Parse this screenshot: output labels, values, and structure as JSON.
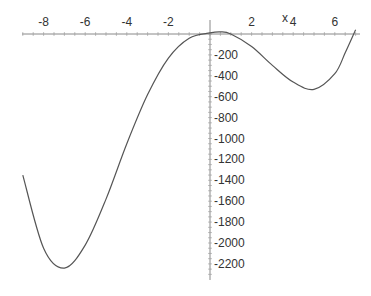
{
  "chart_data": {
    "type": "line",
    "title": "",
    "xlabel": "x",
    "ylabel": "",
    "xlim": [
      -9,
      7
    ],
    "ylim": [
      -2300,
      50
    ],
    "x_ticks": [
      -8,
      -6,
      -4,
      -2,
      2,
      4,
      6
    ],
    "y_ticks": [
      -200,
      -400,
      -600,
      -800,
      -1000,
      -1200,
      -1400,
      -1600,
      -1800,
      -2000,
      -2200
    ],
    "grid": false,
    "series": [
      {
        "name": "f(x)",
        "x": [
          -9,
          -8,
          -7,
          -6,
          -5,
          -4,
          -3,
          -2,
          -1,
          0,
          0.5,
          1,
          2,
          3,
          4,
          5,
          6,
          6.5,
          7
        ],
        "y": [
          -1350,
          -2050,
          -2240,
          -2020,
          -1580,
          -1050,
          -580,
          -230,
          -40,
          10,
          20,
          0,
          -120,
          -300,
          -460,
          -530,
          -380,
          -180,
          40
        ]
      }
    ]
  }
}
